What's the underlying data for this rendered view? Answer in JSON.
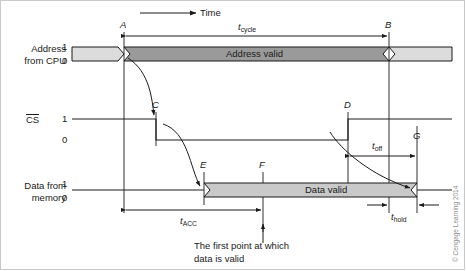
{
  "figure": {
    "kind": "timing-diagram",
    "title_axis": "Time",
    "copyright": "© Cengage Learning 2014"
  },
  "signals": {
    "address": {
      "name_line1": "Address",
      "name_line2": "from CPU",
      "high_label": "1",
      "low_label": "0",
      "valid_text": "Address valid"
    },
    "cs": {
      "name": "CS",
      "name_overline": true,
      "high_label": "1",
      "low_label": "0"
    },
    "data": {
      "name_line1": "Data from",
      "name_line2": "memory",
      "high_label": "1",
      "low_label": "0",
      "valid_text": "Data valid"
    }
  },
  "markers": [
    {
      "id": "A",
      "label": "A",
      "x": 124
    },
    {
      "id": "B",
      "label": "B",
      "x": 389
    },
    {
      "id": "C",
      "label": "C",
      "x": 156
    },
    {
      "id": "D",
      "label": "D",
      "x": 348
    },
    {
      "id": "E",
      "label": "E",
      "x": 204
    },
    {
      "id": "F",
      "label": "F",
      "x": 263
    },
    {
      "id": "G",
      "label": "G",
      "x": 417
    }
  ],
  "timings": [
    {
      "id": "t_cycle",
      "base": "t",
      "sub": "cycle",
      "from": "A",
      "to": "B"
    },
    {
      "id": "t_ACC",
      "base": "t",
      "sub": "ACC",
      "from": "A",
      "to": "F"
    },
    {
      "id": "t_off",
      "base": "t",
      "sub": "off",
      "from": "D",
      "to": "G"
    },
    {
      "id": "t_hold",
      "base": "t",
      "sub": "hold",
      "from": "B",
      "to": "G"
    }
  ],
  "annotation": {
    "line1": "The first point at which",
    "line2": "data is valid",
    "points_to": "F"
  },
  "colors": {
    "ink": "#1a1a1a",
    "bar_light": "#dcdcdc",
    "bar_dark": "#9a9a9a",
    "bar_data": "#c9c9c9",
    "copyright": "#8d8d8d"
  }
}
